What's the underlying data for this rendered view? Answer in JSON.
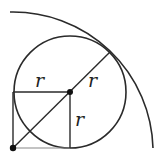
{
  "diagram": {
    "type": "geometry",
    "labels": {
      "horizontal_radius": "r",
      "diagonal_radius": "r",
      "vertical_radius": "r"
    },
    "colors": {
      "stroke": "#2a2a2a",
      "background": "#ffffff"
    }
  }
}
